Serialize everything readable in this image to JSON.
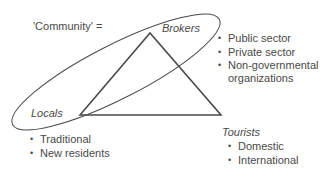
{
  "community_label": "'Community' =",
  "nodes": {
    "brokers": {
      "label": "Brokers",
      "items": [
        "Public sector",
        "Private sector",
        "Non-governmental",
        "organizations"
      ]
    },
    "locals": {
      "label": "Locals",
      "items": [
        "Traditional",
        "New residents"
      ]
    },
    "tourists": {
      "label": "Tourists",
      "items": [
        "Domestic",
        "International"
      ]
    }
  },
  "colors": {
    "line": "#4a4a4a",
    "text": "#4a4a4a",
    "background": "#ffffff"
  }
}
